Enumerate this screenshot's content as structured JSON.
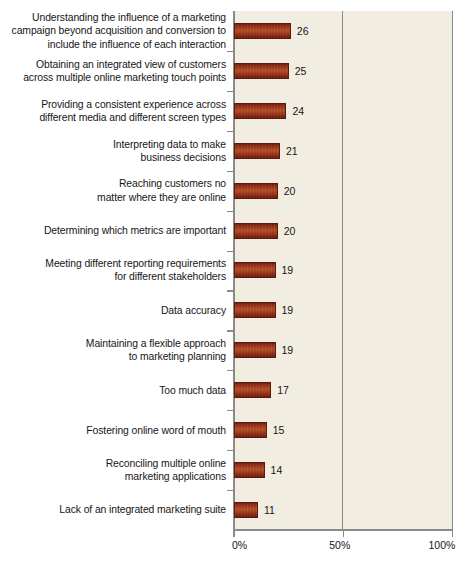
{
  "chart_data": {
    "type": "bar",
    "orientation": "horizontal",
    "title": "",
    "xlabel": "",
    "ylabel": "",
    "xlim": [
      0,
      100
    ],
    "xticks": [
      "0%",
      "50%",
      "100%"
    ],
    "xtick_values": [
      0,
      50,
      100
    ],
    "grid": "vertical gridline at 50%",
    "legend": "none",
    "value_suffix": "%",
    "categories": [
      "Understanding the influence of a marketing campaign beyond acquisition and conversion to include the influence of each interaction",
      "Obtaining an integrated view of customers across multiple online marketing touch points",
      "Providing a consistent experience across different media and different screen types",
      "Interpreting data to make business decisions",
      "Reaching customers no matter where they are online",
      "Determining which metrics are important",
      "Meeting different reporting requirements for different stakeholders",
      "Data accuracy",
      "Maintaining a flexible approach to marketing planning",
      "Too much data",
      "Fostering online word of mouth",
      "Reconciling multiple online marketing applications",
      "Lack of an integrated marketing suite"
    ],
    "values": [
      26,
      25,
      24,
      21,
      20,
      20,
      19,
      19,
      19,
      17,
      15,
      14,
      11
    ]
  },
  "rows": [
    {
      "lines": [
        "Understanding the influence of a marketing",
        "campaign beyond acquisition and conversion to",
        "include the influence of each interaction"
      ],
      "value": 26,
      "value_label": "26"
    },
    {
      "lines": [
        "Obtaining an integrated view of customers",
        "across multiple online marketing touch points"
      ],
      "value": 25,
      "value_label": "25"
    },
    {
      "lines": [
        "Providing a consistent experience across",
        "different media and different screen types"
      ],
      "value": 24,
      "value_label": "24"
    },
    {
      "lines": [
        "Interpreting data to make",
        "business decisions"
      ],
      "value": 21,
      "value_label": "21"
    },
    {
      "lines": [
        "Reaching customers no",
        "matter where they are online"
      ],
      "value": 20,
      "value_label": "20"
    },
    {
      "lines": [
        "Determining which metrics are important"
      ],
      "value": 20,
      "value_label": "20"
    },
    {
      "lines": [
        "Meeting different reporting requirements",
        "for different stakeholders"
      ],
      "value": 19,
      "value_label": "19"
    },
    {
      "lines": [
        "Data accuracy"
      ],
      "value": 19,
      "value_label": "19"
    },
    {
      "lines": [
        "Maintaining a flexible approach",
        "to marketing planning"
      ],
      "value": 19,
      "value_label": "19"
    },
    {
      "lines": [
        "Too much data"
      ],
      "value": 17,
      "value_label": "17"
    },
    {
      "lines": [
        "Fostering online word of mouth"
      ],
      "value": 15,
      "value_label": "15"
    },
    {
      "lines": [
        "Reconciling multiple online",
        "marketing applications"
      ],
      "value": 14,
      "value_label": "14"
    },
    {
      "lines": [
        "Lack of an integrated marketing suite"
      ],
      "value": 11,
      "value_label": "11"
    }
  ],
  "axis": {
    "ticks": [
      {
        "label": "0%",
        "value": 0
      },
      {
        "label": "50%",
        "value": 50
      },
      {
        "label": "100%",
        "value": 100
      }
    ]
  },
  "colors": {
    "bar_dark": "#6d1f12",
    "bar_mid": "#b35128",
    "plot_background": "#f2ede1",
    "axis_line": "#8a8a88",
    "text": "#161616",
    "page_background": "#ffffff"
  }
}
